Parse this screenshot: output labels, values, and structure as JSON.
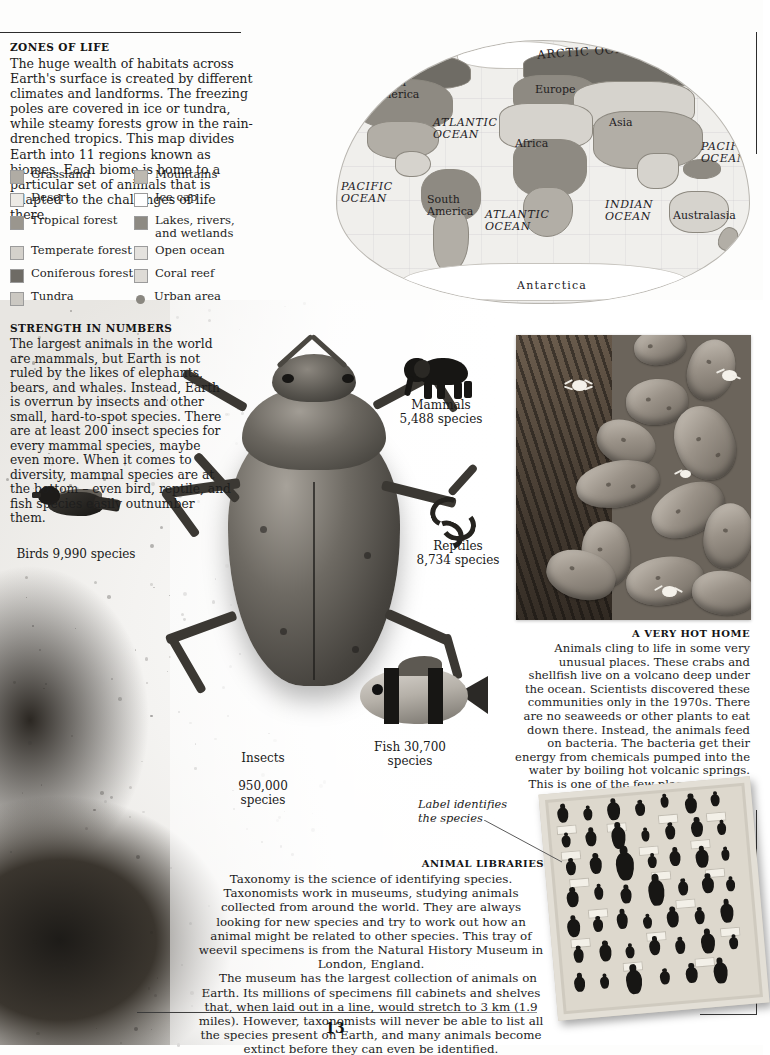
{
  "page": {
    "number": "13"
  },
  "zones": {
    "heading": "ZONES OF LIFE",
    "body": "The huge wealth of habitats across Earth's surface is created by different climates and landforms. The freezing poles are covered in ice or tundra, while steamy forests grow in the rain-drenched tropics. This map divides Earth into 11 regions known as biomes. Each biome is home to a particular set of animals that is adapted to the challenges of life there."
  },
  "legend": {
    "items": [
      {
        "label": "Grassland",
        "color": "#b0aca4",
        "shape": "swatch"
      },
      {
        "label": "Mountains",
        "color": "#bdb9b1",
        "shape": "swatch"
      },
      {
        "label": "Desert",
        "color": "#eceae5",
        "shape": "swatch"
      },
      {
        "label": "Ice cap",
        "color": "#ffffff",
        "shape": "swatch"
      },
      {
        "label": "Tropical forest",
        "color": "#9a968e",
        "shape": "swatch"
      },
      {
        "label": "Lakes, rivers, and wetlands",
        "color": "#8d8a83",
        "shape": "swatch"
      },
      {
        "label": "Temperate forest",
        "color": "#d4d1cb",
        "shape": "swatch"
      },
      {
        "label": "Open ocean",
        "color": "#e4e2de",
        "shape": "swatch"
      },
      {
        "label": "Coniferous forest",
        "color": "#6e6b65",
        "shape": "swatch"
      },
      {
        "label": "Coral reef",
        "color": "#dedbd6",
        "shape": "swatch"
      },
      {
        "label": "Tundra",
        "color": "#cbc8c2",
        "shape": "swatch"
      },
      {
        "label": "Urban area",
        "color": "#8a8780",
        "shape": "dot"
      }
    ]
  },
  "map": {
    "labels": {
      "arctic_ocean": "ARCTIC OCEAN",
      "north_america": "North\nAmerica",
      "south_america": "South\nAmerica",
      "europe": "Europe",
      "asia": "Asia",
      "africa": "Africa",
      "australasia": "Australasia",
      "antarctica": "Antarctica",
      "atlantic_north": "ATLANTIC\nOCEAN",
      "atlantic_south": "ATLANTIC\nOCEAN",
      "pacific_west": "PACIFIC\nOCEAN",
      "pacific_east": "PACIFIC\nOCEAN",
      "indian": "INDIAN\nOCEAN"
    }
  },
  "strength": {
    "heading": "STRENGTH IN NUMBERS",
    "body": "The largest animals in the world are mammals, but Earth is not ruled by the likes of elephants, bears, and whales. Instead, Earth is overrun by insects and other small, hard-to-spot species. There are at least 200 insect species for every mammal species, maybe even more. When it comes to diversity, mammal species are at the bottom – even bird, reptile, and fish species easily outnumber them."
  },
  "animals": {
    "mammals": {
      "name": "Mammals",
      "count": "5,488 species"
    },
    "birds": {
      "name": "Birds 9,990 species",
      "count": ""
    },
    "reptiles": {
      "name": "Reptiles",
      "count": "8,734 species"
    },
    "insects": {
      "name": "Insects",
      "count": "950,000\nspecies"
    },
    "fish": {
      "name": "Fish 30,700",
      "count": "species"
    }
  },
  "hot_home": {
    "heading": "A VERY HOT HOME",
    "body": "Animals cling to life in some very unusual places. These crabs and shellfish live on a volcano deep under the ocean. Scientists discovered these communities only in the 1970s. There are no seaweeds or other plants to eat down there. Instead, the animals feed on bacteria. The bacteria get their energy from chemicals pumped into the water by boiling hot volcanic springs. This is one of the few places on Earth where life exists without the Sun's energy."
  },
  "tray_callout": "Label identifies\nthe species",
  "libraries": {
    "heading": "ANIMAL LIBRARIES",
    "paragraph1": "Taxonomy is the science of identifying species. Taxonomists work in museums, studying animals collected from around the world. They are always looking for new species and try to work out how an animal might be related to other species. This tray of weevil specimens is from the Natural History Museum in London, England.",
    "paragraph2": "The museum has the largest collection of animals on Earth. Its millions of specimens fill cabinets and shelves that, when laid out in a line, would stretch to 3 km (1.9 miles). However, taxonomists will never be able to list all the species present on Earth, and many animals become extinct before they can even be identified."
  }
}
